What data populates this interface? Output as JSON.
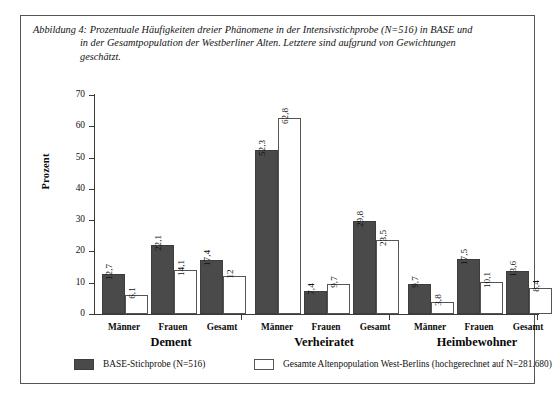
{
  "figure": {
    "caption_lines": [
      "Abbildung 4: Prozentuale Häufigkeiten dreier Phänomene in der Intensivstichprobe (N=516) in BASE und",
      "in der Gesamtpopulation der Westberliner Alten. Letztere sind aufgrund von Gewichtungen",
      "geschätzt."
    ],
    "border_color": "#555555",
    "background": "#ffffff"
  },
  "chart_data": {
    "type": "bar",
    "xlabel": "",
    "ylabel": "Prozent",
    "ylim": [
      0,
      70
    ],
    "ytick_step": 10,
    "yticks": [
      0,
      10,
      20,
      30,
      40,
      50,
      60,
      70
    ],
    "ytick_labels": [
      "0",
      "10",
      "20",
      "30",
      "40",
      "50",
      "60",
      "70"
    ],
    "grid": false,
    "legend_position": "bottom",
    "groups": [
      "Dement",
      "Verheiratet",
      "Heimbewohner"
    ],
    "subcategories": [
      "Männer",
      "Frauen",
      "Gesamt"
    ],
    "categories": [
      "Dement – Männer",
      "Dement – Frauen",
      "Dement – Gesamt",
      "Verheiratet – Männer",
      "Verheiratet – Frauen",
      "Verheiratet – Gesamt",
      "Heimbewohner – Männer",
      "Heimbewohner – Frauen",
      "Heimbewohner – Gesamt"
    ],
    "series": [
      {
        "name": "BASE-Stichprobe (N=516)",
        "color": "#4a4a4a",
        "values": [
          12.7,
          22.1,
          17.4,
          52.3,
          7.4,
          29.8,
          9.7,
          17.5,
          13.6
        ],
        "labels": [
          "12,7",
          "22,1",
          "17,4",
          "52,3",
          "7,4",
          "29,8",
          "9,7",
          "17,5",
          "13,6"
        ]
      },
      {
        "name": "Gesamte Altenpopulation West-Berlins (hochgerechnet auf N=281.680)",
        "color": "#ffffff",
        "values": [
          6.1,
          14.1,
          12,
          62.8,
          9.7,
          23.5,
          3.8,
          10.1,
          8.4
        ],
        "labels": [
          "6,1",
          "14,1",
          "12",
          "62,8",
          "9,7",
          "23,5",
          "3,8",
          "10,1",
          "8,4"
        ]
      }
    ]
  },
  "axis": {
    "y_title": "Prozent"
  },
  "legend": {
    "entries": [
      {
        "label": "BASE-Stichprobe (N=516)",
        "swatch": "dark"
      },
      {
        "label": "Gesamte Altenpopulation West-Berlins (hochgerechnet auf N=281.680)",
        "swatch": "light"
      }
    ]
  }
}
